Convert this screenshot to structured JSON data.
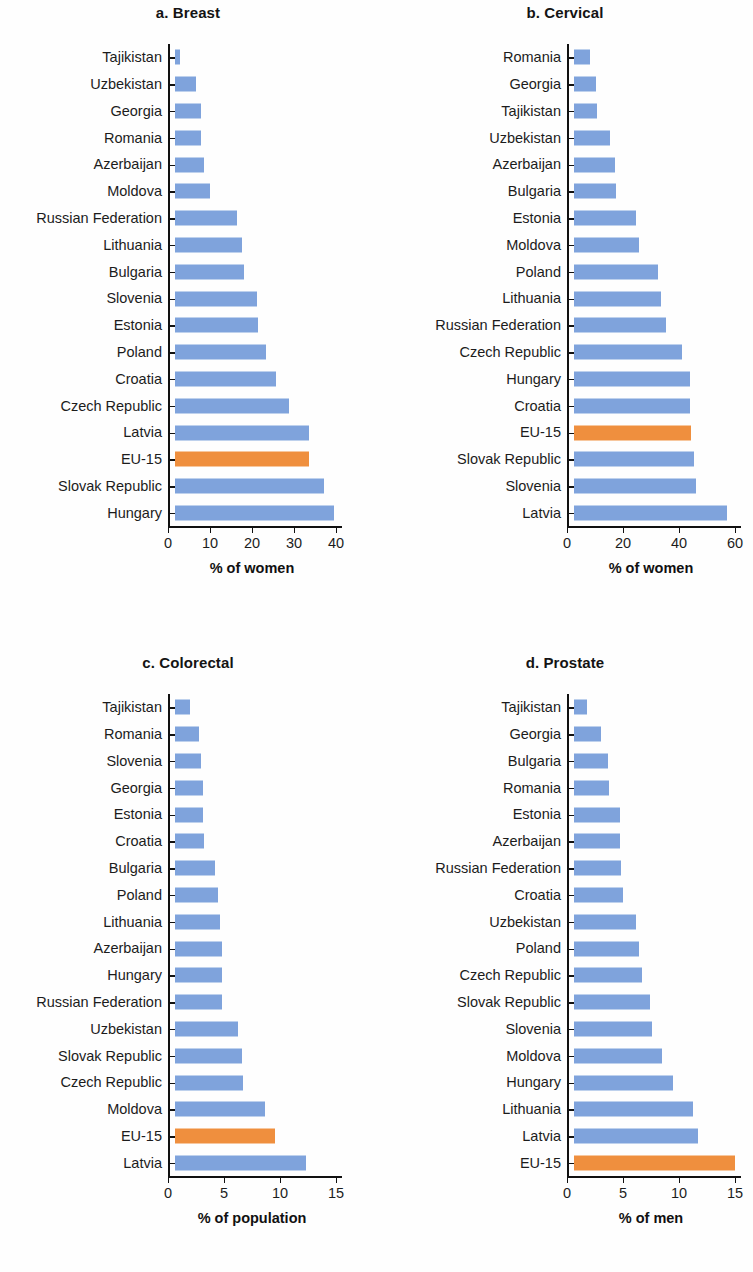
{
  "colors": {
    "bar": "#7fa3dc",
    "highlight": "#ef8f3e",
    "axis": "#111111"
  },
  "highlight_category": "EU-15",
  "chart_data": [
    {
      "type": "bar",
      "orientation": "horizontal",
      "title": "a. Breast",
      "xlabel": "% of women",
      "ylabel": "",
      "xlim": [
        0,
        40
      ],
      "xticks": [
        0,
        10,
        20,
        30,
        40
      ],
      "grid": false,
      "legend": "none",
      "categories": [
        "Tajikistan",
        "Uzbekistan",
        "Georgia",
        "Romania",
        "Azerbaijan",
        "Moldova",
        "Russian Federation",
        "Lithuania",
        "Bulgaria",
        "Slovenia",
        "Estonia",
        "Poland",
        "Croatia",
        "Czech Republic",
        "Latvia",
        "EU-15",
        "Slovak Republic",
        "Hungary"
      ],
      "values": [
        1.2,
        5.0,
        6.2,
        6.2,
        7.0,
        8.4,
        14.8,
        15.9,
        16.4,
        19.6,
        19.7,
        21.6,
        24.1,
        27.2,
        31.8,
        31.9,
        35.4,
        37.8
      ]
    },
    {
      "type": "bar",
      "orientation": "horizontal",
      "title": "b. Cervical",
      "xlabel": "% of women",
      "ylabel": "",
      "xlim": [
        0,
        60
      ],
      "xticks": [
        0,
        20,
        40,
        60
      ],
      "grid": false,
      "legend": "none",
      "categories": [
        "Romania",
        "Georgia",
        "Tajikistan",
        "Uzbekistan",
        "Azerbaijan",
        "Bulgaria",
        "Estonia",
        "Moldova",
        "Poland",
        "Lithuania",
        "Russian Federation",
        "Czech Republic",
        "Hungary",
        "Croatia",
        "EU-15",
        "Slovak Republic",
        "Slovenia",
        "Latvia"
      ],
      "values": [
        5.8,
        8.0,
        8.1,
        13.0,
        14.8,
        14.9,
        22.2,
        23.3,
        30.1,
        31.0,
        32.7,
        38.6,
        41.4,
        41.5,
        41.9,
        43.0,
        43.6,
        54.6
      ]
    },
    {
      "type": "bar",
      "orientation": "horizontal",
      "title": "c. Colorectal",
      "xlabel": "% of population",
      "ylabel": "",
      "xlim": [
        0,
        15
      ],
      "xticks": [
        0,
        5,
        10,
        15
      ],
      "grid": false,
      "legend": "none",
      "categories": [
        "Tajikistan",
        "Romania",
        "Slovenia",
        "Georgia",
        "Estonia",
        "Croatia",
        "Bulgaria",
        "Poland",
        "Lithuania",
        "Azerbaijan",
        "Hungary",
        "Russian Federation",
        "Uzbekistan",
        "Slovak Republic",
        "Czech Republic",
        "Moldova",
        "EU-15",
        "Latvia"
      ],
      "values": [
        1.3,
        2.1,
        2.3,
        2.5,
        2.5,
        2.6,
        3.6,
        3.8,
        4.0,
        4.2,
        4.2,
        4.2,
        5.6,
        6.0,
        6.1,
        8.0,
        8.9,
        11.7
      ]
    },
    {
      "type": "bar",
      "orientation": "horizontal",
      "title": "d. Prostate",
      "xlabel": "% of men",
      "ylabel": "",
      "xlim": [
        0,
        15
      ],
      "xticks": [
        0,
        5,
        10,
        15
      ],
      "grid": false,
      "legend": "none",
      "categories": [
        "Tajikistan",
        "Georgia",
        "Bulgaria",
        "Romania",
        "Estonia",
        "Azerbaijan",
        "Russian Federation",
        "Croatia",
        "Uzbekistan",
        "Poland",
        "Czech Republic",
        "Slovak Republic",
        "Slovenia",
        "Moldova",
        "Hungary",
        "Lithuania",
        "Latvia",
        "EU-15"
      ],
      "values": [
        1.2,
        2.4,
        3.0,
        3.1,
        4.1,
        4.1,
        4.2,
        4.4,
        5.5,
        5.8,
        6.1,
        6.8,
        7.0,
        7.9,
        8.8,
        10.6,
        11.1,
        14.4
      ]
    }
  ]
}
